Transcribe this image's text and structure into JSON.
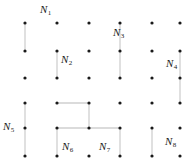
{
  "figure": {
    "title": "",
    "width": 190,
    "height": 167,
    "background": "#ffffff",
    "dot_color": "#1a1a1a",
    "line_color": "#cfcfcf",
    "label_color": "#1a1a1a"
  },
  "grid": {
    "columns": 6,
    "rows": 6,
    "col_x": [
      25,
      57,
      89,
      120,
      152,
      180
    ],
    "row_y": [
      23,
      51,
      78,
      103,
      128,
      156
    ],
    "dot_radius": 1.6
  },
  "regions": [
    {
      "id": "N1",
      "label": "N",
      "sub": "1",
      "label_x": 40,
      "label_y": 4,
      "segments": [
        {
          "type": "vertical",
          "col": 0,
          "row_from": 0,
          "row_to": 1
        }
      ]
    },
    {
      "id": "N2",
      "label": "N",
      "sub": "2",
      "label_x": 61,
      "label_y": 54,
      "segments": [
        {
          "type": "vertical",
          "col": 1,
          "row_from": 1,
          "row_to": 2
        }
      ]
    },
    {
      "id": "N3",
      "label": "N",
      "sub": "3",
      "label_x": 113,
      "label_y": 27,
      "segments": [
        {
          "type": "vertical",
          "col": 3,
          "row_from": 0,
          "row_to": 1
        },
        {
          "type": "vertical",
          "col": 3,
          "row_from": 1,
          "row_to": 2
        }
      ]
    },
    {
      "id": "N4",
      "label": "N",
      "sub": "4",
      "label_x": 166,
      "label_y": 58,
      "segments": [
        {
          "type": "vertical",
          "col": 5,
          "row_from": 1,
          "row_to": 2
        },
        {
          "type": "vertical",
          "col": 5,
          "row_from": 2,
          "row_to": 3
        }
      ]
    },
    {
      "id": "N5",
      "label": "N",
      "sub": "5",
      "label_x": 3,
      "label_y": 121,
      "segments": [
        {
          "type": "vertical",
          "col": 0,
          "row_from": 3,
          "row_to": 4
        },
        {
          "type": "vertical",
          "col": 0,
          "row_from": 4,
          "row_to": 5
        }
      ]
    },
    {
      "id": "N6",
      "label": "N",
      "sub": "6",
      "label_x": 62,
      "label_y": 141,
      "segments": [
        {
          "type": "horizontal",
          "row": 3,
          "col_from": 1,
          "col_to": 2
        },
        {
          "type": "vertical",
          "col": 2,
          "row_from": 3,
          "row_to": 4
        },
        {
          "type": "horizontal",
          "row": 4,
          "col_from": 1,
          "col_to": 2
        },
        {
          "type": "vertical",
          "col": 1,
          "row_from": 4,
          "row_to": 5
        }
      ]
    },
    {
      "id": "N7",
      "label": "N",
      "sub": "7",
      "label_x": 99,
      "label_y": 141,
      "segments": [
        {
          "type": "horizontal",
          "row": 4,
          "col_from": 2,
          "col_to": 3
        },
        {
          "type": "vertical",
          "col": 3,
          "row_from": 4,
          "row_to": 5
        }
      ]
    },
    {
      "id": "N8",
      "label": "N",
      "sub": "8",
      "label_x": 165,
      "label_y": 136,
      "segments": [
        {
          "type": "vertical",
          "col": 4,
          "row_from": 4,
          "row_to": 5
        }
      ]
    }
  ]
}
